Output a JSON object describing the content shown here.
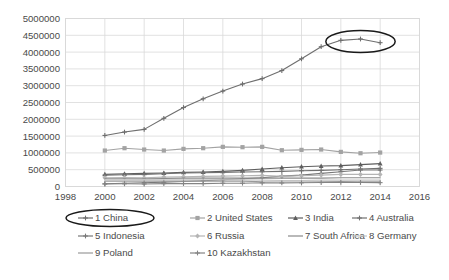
{
  "chart_data": {
    "type": "line",
    "title": "",
    "subtitle": "",
    "xlabel": "",
    "ylabel": "",
    "xlim": [
      1998,
      2016
    ],
    "ylim": [
      0,
      5000000
    ],
    "grid": true,
    "legend_position": "bottom",
    "x": [
      2000,
      2001,
      2002,
      2003,
      2004,
      2005,
      2006,
      2007,
      2008,
      2009,
      2010,
      2011,
      2012,
      2013,
      2014
    ],
    "ytick_labels": [
      "5000000",
      "4500000",
      "4000000",
      "3500000",
      "3000000",
      "2500000",
      "2000000",
      "1500000",
      "1000000",
      "500000",
      "0"
    ],
    "ytick_values": [
      5000000,
      4500000,
      4000000,
      3500000,
      3000000,
      2500000,
      2000000,
      1500000,
      1000000,
      500000,
      0
    ],
    "xtick_labels": [
      "1998",
      "2000",
      "2002",
      "2004",
      "2006",
      "2008",
      "2010",
      "2012",
      "2014",
      "2016"
    ],
    "xtick_values": [
      1998,
      2000,
      2002,
      2004,
      2006,
      2008,
      2010,
      2012,
      2014,
      2016
    ],
    "series": [
      {
        "name": "1 China",
        "legend_label": "1 China",
        "color": "#6e6e6e",
        "marker": "cross",
        "values": [
          1520000,
          1620000,
          1700000,
          2030000,
          2350000,
          2610000,
          2840000,
          3050000,
          3210000,
          3450000,
          3800000,
          4160000,
          4350000,
          4390000,
          4280000
        ]
      },
      {
        "name": "2 United States",
        "legend_label": "2 United States",
        "color": "#a3a3a3",
        "marker": "square",
        "values": [
          1070000,
          1140000,
          1100000,
          1070000,
          1120000,
          1140000,
          1180000,
          1170000,
          1180000,
          1080000,
          1090000,
          1100000,
          1030000,
          990000,
          1010000
        ]
      },
      {
        "name": "3 India",
        "legend_label": "3 India",
        "color": "#5e5e5e",
        "marker": "triangle",
        "values": [
          360000,
          380000,
          390000,
          400000,
          420000,
          430000,
          450000,
          480000,
          520000,
          560000,
          590000,
          610000,
          620000,
          650000,
          680000
        ]
      },
      {
        "name": "4 Australia",
        "legend_label": "4 Australia",
        "color": "#707070",
        "marker": "cross",
        "values": [
          340000,
          350000,
          360000,
          380000,
          400000,
          410000,
          420000,
          430000,
          440000,
          450000,
          470000,
          480000,
          500000,
          520000,
          540000
        ]
      },
      {
        "name": "5 Indonesia",
        "legend_label": "5 Indonesia",
        "color": "#787878",
        "marker": "cross",
        "values": [
          80000,
          95000,
          110000,
          130000,
          150000,
          170000,
          200000,
          230000,
          260000,
          310000,
          340000,
          390000,
          440000,
          490000,
          490000
        ]
      },
      {
        "name": "6 Russia",
        "legend_label": "6 Russia",
        "color": "#b5b5b5",
        "marker": "diamond",
        "values": [
          260000,
          270000,
          260000,
          280000,
          290000,
          300000,
          310000,
          320000,
          330000,
          300000,
          320000,
          340000,
          360000,
          360000,
          360000
        ]
      },
      {
        "name": "7 South Africa",
        "legend_label": "7 South Africa",
        "color": "#8a8a8a",
        "marker": "none",
        "values": [
          230000,
          230000,
          230000,
          240000,
          250000,
          250000,
          250000,
          250000,
          250000,
          250000,
          250000,
          250000,
          260000,
          260000,
          260000
        ]
      },
      {
        "name": "8 Germany",
        "legend_label": "8 Germany",
        "color": "#c4c4c4",
        "marker": "none",
        "values": [
          200000,
          200000,
          210000,
          200000,
          200000,
          200000,
          200000,
          200000,
          190000,
          180000,
          180000,
          190000,
          190000,
          190000,
          190000
        ]
      },
      {
        "name": "9 Poland",
        "legend_label": "9 Poland",
        "color": "#9a9a9a",
        "marker": "none",
        "values": [
          160000,
          160000,
          160000,
          160000,
          160000,
          160000,
          160000,
          160000,
          140000,
          135000,
          135000,
          140000,
          145000,
          140000,
          140000
        ]
      },
      {
        "name": "10 Kazakhstan",
        "legend_label": "10 Kazakhstan",
        "color": "#848484",
        "marker": "cross",
        "values": [
          75000,
          80000,
          75000,
          85000,
          87000,
          87000,
          97000,
          98000,
          110000,
          105000,
          110000,
          117000,
          120000,
          120000,
          115000
        ]
      }
    ],
    "annotations": [
      {
        "name": "china-peak-highlight",
        "shape": "ellipse",
        "target": "China 2012-2014 data points",
        "color": "#1a1a1a"
      },
      {
        "name": "china-legend-highlight",
        "shape": "ellipse",
        "target": "1 China legend entry",
        "color": "#1a1a1a"
      }
    ]
  }
}
